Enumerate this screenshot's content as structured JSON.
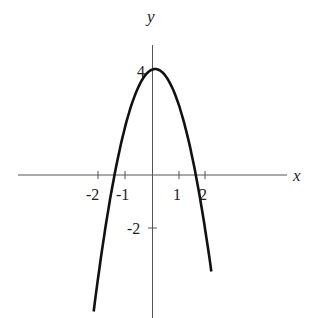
{
  "chart_data": {
    "type": "line",
    "title": "",
    "xlabel": "x",
    "ylabel": "y",
    "x_ticks": [
      -2,
      -1,
      1,
      2
    ],
    "x_tick_labels": [
      "-2",
      "-1",
      "1",
      "2"
    ],
    "y_ticks": [
      4,
      -2
    ],
    "y_tick_labels": [
      "4",
      "-2"
    ],
    "xlim": [
      -5.1,
      5.1
    ],
    "ylim": [
      -5.3,
      4.9
    ],
    "grid": false,
    "series": [
      {
        "name": "parabola",
        "function": "approx 4 - 1.7*(x-0.1)^2",
        "x": [
          -2.2,
          -1.5,
          -1.0,
          -0.5,
          0.1,
          0.5,
          1.0,
          1.5,
          2.2
        ],
        "y": [
          -5.0,
          -0.5,
          1.9,
          3.3,
          4.0,
          3.7,
          2.6,
          0.7,
          -5.0
        ]
      }
    ]
  },
  "labels": {
    "x": "x",
    "y": "y",
    "t_m2": "-2",
    "t_m1": "-1",
    "t_1": "1",
    "t_2": "2",
    "t_y4": "4",
    "t_ym2": "-2"
  }
}
